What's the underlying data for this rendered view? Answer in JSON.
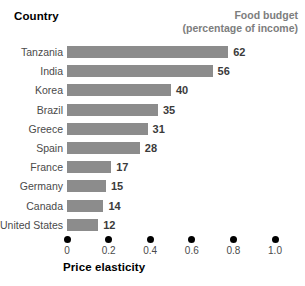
{
  "headers": {
    "country": "Country",
    "budget_line1": "Food budget",
    "budget_line2": "(percentage of income)"
  },
  "axis": {
    "title": "Price elasticity",
    "tick_labels": [
      "0",
      "0.2",
      "0.4",
      "0.6",
      "0.8",
      "1.0"
    ]
  },
  "colors": {
    "bar": "#8c8c8c",
    "header_accent": "#7d7d7d",
    "text": "#4a4a4a",
    "dot": "#000000"
  },
  "chart_data": {
    "type": "bar",
    "title": "Food budget (percentage of income)",
    "xlabel": "Price elasticity",
    "ylabel": "Country",
    "orientation": "horizontal",
    "grid": false,
    "legend": "none",
    "xlim": [
      0,
      1.0
    ],
    "xticks": [
      0,
      0.2,
      0.4,
      0.6,
      0.8,
      1.0
    ],
    "xticklabels": [
      "0",
      "0.2",
      "0.4",
      "0.6",
      "0.8",
      "1.0"
    ],
    "value_suffix": "",
    "categories": [
      "Tanzania",
      "India",
      "Korea",
      "Brazil",
      "Greece",
      "Spain",
      "France",
      "Germany",
      "Canada",
      "United States"
    ],
    "values": [
      62,
      56,
      40,
      35,
      31,
      28,
      17,
      15,
      14,
      12
    ],
    "series": [
      {
        "name": "Food budget (percentage of income)",
        "values": [
          62,
          56,
          40,
          35,
          31,
          28,
          17,
          15,
          14,
          12
        ]
      }
    ]
  },
  "rows": [
    {
      "country": "Tanzania",
      "value": 62,
      "label": "62"
    },
    {
      "country": "India",
      "value": 56,
      "label": "56"
    },
    {
      "country": "Korea",
      "value": 40,
      "label": "40"
    },
    {
      "country": "Brazil",
      "value": 35,
      "label": "35"
    },
    {
      "country": "Greece",
      "value": 31,
      "label": "31"
    },
    {
      "country": "Spain",
      "value": 28,
      "label": "28"
    },
    {
      "country": "France",
      "value": 17,
      "label": "17"
    },
    {
      "country": "Germany",
      "value": 15,
      "label": "15"
    },
    {
      "country": "Canada",
      "value": 14,
      "label": "14"
    },
    {
      "country": "United States",
      "value": 12,
      "label": "12"
    }
  ]
}
